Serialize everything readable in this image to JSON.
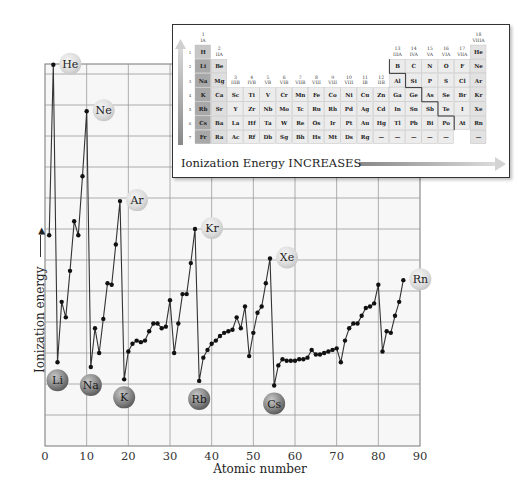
{
  "chart_data": {
    "type": "line",
    "title": "",
    "xlabel": "Atomic number",
    "ylabel": "Ionization energy",
    "ylabel_arrow": "→",
    "xlim": [
      0,
      90
    ],
    "xticks": [
      0,
      10,
      20,
      30,
      40,
      50,
      60,
      70,
      80,
      90
    ],
    "ylim_ev": [
      0,
      25
    ],
    "grid": true,
    "yticks_labeled": false,
    "series": [
      {
        "name": "First ionization energy (eV)",
        "x": [
          1,
          2,
          3,
          4,
          5,
          6,
          7,
          8,
          9,
          10,
          11,
          12,
          13,
          14,
          15,
          16,
          17,
          18,
          19,
          20,
          21,
          22,
          23,
          24,
          25,
          26,
          27,
          28,
          29,
          30,
          31,
          32,
          33,
          34,
          35,
          36,
          37,
          38,
          39,
          40,
          41,
          42,
          43,
          44,
          45,
          46,
          47,
          48,
          49,
          50,
          51,
          52,
          53,
          54,
          55,
          56,
          57,
          58,
          59,
          60,
          61,
          62,
          63,
          64,
          65,
          66,
          67,
          68,
          69,
          70,
          71,
          72,
          73,
          74,
          75,
          76,
          77,
          78,
          79,
          80,
          81,
          82,
          83,
          84,
          85,
          86
        ],
        "values": [
          13.6,
          24.6,
          5.4,
          9.3,
          8.3,
          11.3,
          14.5,
          13.6,
          17.4,
          21.6,
          5.1,
          7.6,
          6.0,
          8.2,
          10.5,
          10.4,
          13.0,
          15.8,
          4.3,
          6.1,
          6.6,
          6.8,
          6.7,
          6.8,
          7.4,
          7.9,
          7.9,
          7.6,
          7.7,
          9.4,
          6.0,
          7.9,
          9.8,
          9.8,
          11.8,
          14.0,
          4.2,
          5.7,
          6.2,
          6.6,
          6.8,
          7.1,
          7.3,
          7.4,
          7.5,
          8.3,
          7.6,
          9.0,
          5.8,
          7.3,
          8.6,
          9.0,
          10.5,
          12.1,
          3.9,
          5.2,
          5.6,
          5.5,
          5.5,
          5.5,
          5.6,
          5.6,
          5.7,
          6.2,
          5.9,
          5.9,
          6.0,
          6.1,
          6.2,
          6.3,
          5.4,
          6.8,
          7.6,
          7.9,
          7.9,
          8.4,
          8.9,
          9.0,
          9.2,
          10.4,
          6.1,
          7.4,
          7.3,
          8.4,
          9.3,
          10.7
        ]
      }
    ],
    "plotted_segments_note": "Hydrogen (Z=1) point hidden behind axis start; plotted line begins at He (Z=2) ... actually H is drawn at Z=1",
    "annotations": {
      "noble_gases": [
        {
          "label": "He",
          "z": 2
        },
        {
          "label": "Ne",
          "z": 10
        },
        {
          "label": "Ar",
          "z": 18
        },
        {
          "label": "Kr",
          "z": 36
        },
        {
          "label": "Xe",
          "z": 54
        },
        {
          "label": "Rn",
          "z": 86
        }
      ],
      "alkali_metals": [
        {
          "label": "Li",
          "z": 3
        },
        {
          "label": "Na",
          "z": 11
        },
        {
          "label": "K",
          "z": 19
        },
        {
          "label": "Rb",
          "z": 37
        },
        {
          "label": "Cs",
          "z": 55
        }
      ]
    },
    "legend": "none"
  },
  "inset": {
    "caption": "Ionization Energy INCREASES",
    "groups_top": [
      {
        "num": "1",
        "roman": "IA"
      },
      {
        "num": "2",
        "roman": "IIA"
      },
      {
        "num": "3",
        "roman": "IIIB"
      },
      {
        "num": "4",
        "roman": "IVB"
      },
      {
        "num": "5",
        "roman": "VB"
      },
      {
        "num": "6",
        "roman": "VIB"
      },
      {
        "num": "7",
        "roman": "VIIB"
      },
      {
        "num": "8",
        "roman": "VIII"
      },
      {
        "num": "9",
        "roman": "VIII"
      },
      {
        "num": "10",
        "roman": "VIII"
      },
      {
        "num": "11",
        "roman": "IB"
      },
      {
        "num": "12",
        "roman": "IIB"
      },
      {
        "num": "13",
        "roman": "IIIA"
      },
      {
        "num": "14",
        "roman": "IVA"
      },
      {
        "num": "15",
        "roman": "VA"
      },
      {
        "num": "16",
        "roman": "VIA"
      },
      {
        "num": "17",
        "roman": "VIIA"
      },
      {
        "num": "18",
        "roman": "VIIIA"
      }
    ],
    "periods": [
      "1",
      "2",
      "3",
      "4",
      "5",
      "6",
      "7"
    ],
    "rows": [
      [
        "H",
        "",
        "",
        "",
        "",
        "",
        "",
        "",
        "",
        "",
        "",
        "",
        "",
        "",
        "",
        "",
        "",
        "He"
      ],
      [
        "Li",
        "Be",
        "",
        "",
        "",
        "",
        "",
        "",
        "",
        "",
        "",
        "",
        "B",
        "C",
        "N",
        "O",
        "F",
        "Ne"
      ],
      [
        "Na",
        "Mg",
        "",
        "",
        "",
        "",
        "",
        "",
        "",
        "",
        "",
        "",
        "Al",
        "Si",
        "P",
        "S",
        "Cl",
        "Ar"
      ],
      [
        "K",
        "Ca",
        "Sc",
        "Ti",
        "V",
        "Cr",
        "Mn",
        "Fe",
        "Co",
        "Ni",
        "Cu",
        "Zn",
        "Ga",
        "Ge",
        "As",
        "Se",
        "Br",
        "Kr"
      ],
      [
        "Rb",
        "Sr",
        "Y",
        "Zr",
        "Nb",
        "Mo",
        "Tc",
        "Ru",
        "Rh",
        "Pd",
        "Ag",
        "Cd",
        "In",
        "Sn",
        "Sb",
        "Te",
        "I",
        "Xe"
      ],
      [
        "Cs",
        "Ba",
        "La",
        "Hf",
        "Ta",
        "W",
        "Re",
        "Os",
        "Ir",
        "Pt",
        "Au",
        "Hg",
        "Tl",
        "Pb",
        "Bi",
        "Po",
        "At",
        "Rn"
      ],
      [
        "Fr",
        "Ra",
        "Ac",
        "Rf",
        "Db",
        "Sg",
        "Bh",
        "Hs",
        "Mt",
        "Ds",
        "Rg",
        "—",
        "—",
        "—",
        "—",
        "—",
        "",
        "—"
      ]
    ]
  }
}
